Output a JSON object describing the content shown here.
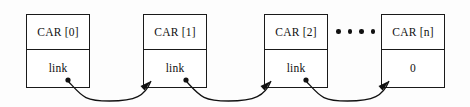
{
  "diagram": {
    "type": "linked-list-diagram",
    "background_color": "#fdfdfd",
    "line_color": "#111111",
    "box_fill": "#ffffff",
    "nodes": [
      {
        "id": "node-0",
        "top_label": "CAR [0]",
        "bottom_label": "link",
        "x": 26,
        "y": 14,
        "width": 64,
        "height": 74,
        "has_link_dot": true,
        "receives_arrow": false
      },
      {
        "id": "node-1",
        "top_label": "CAR [1]",
        "bottom_label": "link",
        "x": 143,
        "y": 14,
        "width": 64,
        "height": 74,
        "has_link_dot": true,
        "receives_arrow": true
      },
      {
        "id": "node-2",
        "top_label": "CAR [2]",
        "bottom_label": "link",
        "x": 264,
        "y": 14,
        "width": 64,
        "height": 74,
        "has_link_dot": true,
        "receives_arrow": true
      },
      {
        "id": "node-n",
        "top_label": "CAR [n]",
        "bottom_label": "0",
        "x": 381,
        "y": 14,
        "width": 64,
        "height": 74,
        "has_link_dot": false,
        "receives_arrow": true
      }
    ],
    "ellipsis": {
      "name": "continuation-dots",
      "dot_count": 4,
      "x": 336,
      "y": 29
    },
    "connectors": [
      {
        "id": "link-0-to-1",
        "from_node": "node-0",
        "to_node": "node-1",
        "source_dot": [
          68,
          80
        ],
        "arrow_tip": [
          151,
          81
        ]
      },
      {
        "id": "link-1-to-2",
        "from_node": "node-1",
        "to_node": "node-2",
        "source_dot": [
          186,
          80
        ],
        "arrow_tip": [
          271,
          81
        ]
      },
      {
        "id": "link-2-to-n",
        "from_node": "node-2",
        "to_node": "node-n",
        "source_dot": [
          306,
          80
        ],
        "arrow_tip": [
          389,
          81
        ]
      }
    ]
  }
}
